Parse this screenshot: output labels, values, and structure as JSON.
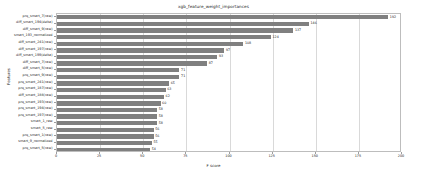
{
  "chart_data": {
    "type": "bar",
    "orientation": "horizontal",
    "title": "xgb_feature_weight_importances",
    "xlabel": "F score",
    "ylabel": "Features",
    "xlim": [
      0,
      200
    ],
    "xticks": [
      0,
      25,
      50,
      75,
      100,
      125,
      150,
      175,
      200
    ],
    "grid": true,
    "legend": false,
    "bar_color": "#808080",
    "categories": [
      "prq_smart_7(raw)",
      "diff_smart_194(delta)",
      "diff_smart_9(raw)",
      "smart_193_normalized",
      "diff_smart_241(raw)",
      "diff_smart_197(raw)",
      "diff_smart_199(delta)",
      "diff_smart_7(raw)",
      "diff_smart_5(raw)",
      "prq_smart_9(raw)",
      "prq_smart_241(raw)",
      "prq_smart_187(raw)",
      "diff_smart_188(raw)",
      "prq_smart_193(raw)",
      "prq_smart_194(raw)",
      "prq_smart_197(raw)",
      "smart_1_raw",
      "smart_5_raw",
      "prq_smart_1(raw)",
      "smart_9_normalized",
      "prq_smart_5(raw)"
    ],
    "values": [
      192,
      146,
      137,
      124,
      108,
      97,
      93,
      87,
      71,
      71,
      65,
      63,
      62,
      60,
      58,
      58,
      58,
      56,
      56,
      55,
      54
    ]
  }
}
